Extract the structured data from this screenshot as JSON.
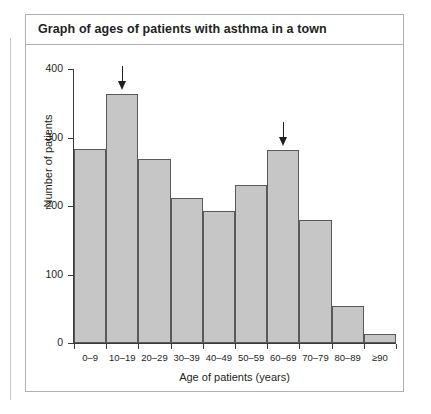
{
  "panel": {
    "title": "Graph of ages of patients with asthma in a town"
  },
  "chart_data": {
    "type": "bar",
    "title": "Graph of ages of patients with asthma in a town",
    "xlabel": "Age of patients (years)",
    "ylabel": "Number of patients",
    "categories": [
      "0–9",
      "10–19",
      "20–29",
      "30–39",
      "40–49",
      "50–59",
      "60–69",
      "70–79",
      "80–89",
      "≥90"
    ],
    "values": [
      283,
      364,
      268,
      211,
      192,
      231,
      282,
      180,
      54,
      13
    ],
    "ylim": [
      0,
      400
    ],
    "yticks": [
      0,
      100,
      200,
      300,
      400
    ],
    "ytick_labels": [
      "0",
      "100",
      "200",
      "300",
      "400"
    ],
    "grid": false,
    "legend": false,
    "bar_fill": "#c6c6c6",
    "bar_edge": "#5a5a5a",
    "annotations": [
      {
        "name": "arrow-10-19",
        "category": "10–19",
        "symbol": "↓"
      },
      {
        "name": "arrow-60-69",
        "category": "60–69",
        "symbol": "↓"
      }
    ]
  }
}
